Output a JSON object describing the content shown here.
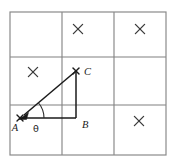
{
  "figure": {
    "background_color": "#ffffff",
    "grid": {
      "rows": 3,
      "cols": 3,
      "left": 10,
      "top": 12,
      "right": 166,
      "bottom": 155,
      "x_lines": [
        10,
        62,
        114,
        166
      ],
      "y_lines": [
        12,
        57,
        105,
        155
      ],
      "line_color": "#808080",
      "border_color": "#8a8a8a"
    },
    "cell_marks": [
      {
        "name": "cross-top-middle",
        "glyph": "x",
        "cx": 78,
        "cy": 29,
        "size": 4.6
      },
      {
        "name": "cross-top-right",
        "glyph": "x",
        "cx": 140,
        "cy": 29,
        "size": 4.6
      },
      {
        "name": "cross-middle-left",
        "glyph": "x",
        "cx": 33,
        "cy": 72,
        "size": 4.6
      },
      {
        "name": "cross-bottom-right",
        "glyph": "x",
        "cx": 139,
        "cy": 121,
        "size": 4.6
      }
    ],
    "triangle": {
      "name": "right-triangle-ABC",
      "stroke_color": "#1a1a1a",
      "vertices": [
        {
          "label": "A",
          "x": 20,
          "y": 118,
          "label_x": 15,
          "label_y": 131,
          "marked": true
        },
        {
          "label": "B",
          "x": 76,
          "y": 118,
          "label_x": 80,
          "label_y": 128,
          "marked": false
        },
        {
          "label": "C",
          "x": 76,
          "y": 71,
          "label_x": 84,
          "label_y": 72,
          "marked": true
        }
      ],
      "sides": [
        {
          "name": "hypotenuse-AC",
          "from": "A",
          "to": "C"
        },
        {
          "name": "vertical-CB",
          "from": "C",
          "to": "B"
        },
        {
          "name": "horizontal-AB",
          "from": "A",
          "to": "B"
        }
      ],
      "arrow_at": "A",
      "angle": {
        "name": "angle-theta-at-A",
        "symbol": "θ",
        "at_vertex": "A",
        "label_x": 36,
        "label_y": 131,
        "arc_radius": 24
      }
    }
  }
}
